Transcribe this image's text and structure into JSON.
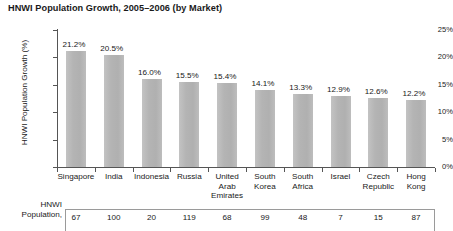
{
  "chart_data": {
    "type": "bar",
    "title": "HNWI Population Growth, 2005–2006 (by Market)",
    "xlabel": "",
    "ylabel": "HNWI Population Growth (%)",
    "ylim": [
      0,
      25
    ],
    "ytick_labels": [
      "25%",
      "20%",
      "15%",
      "10%",
      "5%",
      "0%"
    ],
    "ytick_values": [
      25,
      20,
      15,
      10,
      5,
      0
    ],
    "grid": false,
    "legend": "none",
    "categories": [
      "Singapore",
      "India",
      "Indonesia",
      "Russia",
      "United Arab Emirates",
      "South Korea",
      "South Africa",
      "Israel",
      "Czech Republic",
      "Hong Kong"
    ],
    "values": [
      21.2,
      20.5,
      16.0,
      15.5,
      15.4,
      14.1,
      13.3,
      12.9,
      12.6,
      12.2
    ],
    "value_labels": [
      "21.2%",
      "20.5%",
      "16.0%",
      "15.5%",
      "15.4%",
      "14.1%",
      "13.3%",
      "12.9%",
      "12.6%",
      "12.2%"
    ],
    "bar_color": "#b4b4b4",
    "axis_color": "#555555"
  },
  "category_lines": [
    [
      "Singapore"
    ],
    [
      "India"
    ],
    [
      "Indonesia"
    ],
    [
      "Russia"
    ],
    [
      "United",
      "Arab",
      "Emirates"
    ],
    [
      "South",
      "Korea"
    ],
    [
      "South",
      "Africa"
    ],
    [
      "Israel"
    ],
    [
      "Czech",
      "Republic"
    ],
    [
      "Hong",
      "Kong"
    ]
  ],
  "table": {
    "row_label_lines": [
      "HNWI",
      "Population,"
    ],
    "values": [
      "67",
      "100",
      "20",
      "119",
      "68",
      "99",
      "48",
      "7",
      "15",
      "87"
    ]
  }
}
